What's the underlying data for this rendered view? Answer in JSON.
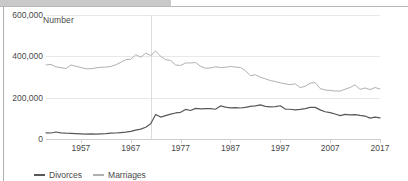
{
  "chart_data": {
    "type": "line",
    "title": "",
    "xlabel": "",
    "ylabel": "Number",
    "xlim": [
      1950,
      2017
    ],
    "ylim": [
      0,
      600000
    ],
    "grid": true,
    "legend_position": "bottom-left",
    "yticks": [
      "0",
      "200,000",
      "400,000",
      "600,000"
    ],
    "ytick_values": [
      0,
      200000,
      400000,
      600000
    ],
    "xticks": [
      "1957",
      "1967",
      "1977",
      "1987",
      "1997",
      "2007",
      "2017"
    ],
    "xtick_values": [
      1957,
      1967,
      1977,
      1987,
      1997,
      2007,
      2017
    ],
    "annotations": [
      {
        "type": "vertical-line",
        "x": 1971,
        "label": ""
      }
    ],
    "x": [
      1950,
      1951,
      1952,
      1953,
      1954,
      1955,
      1956,
      1957,
      1958,
      1959,
      1960,
      1961,
      1962,
      1963,
      1964,
      1965,
      1966,
      1967,
      1968,
      1969,
      1970,
      1971,
      1972,
      1973,
      1974,
      1975,
      1976,
      1977,
      1978,
      1979,
      1980,
      1981,
      1982,
      1983,
      1984,
      1985,
      1986,
      1987,
      1988,
      1989,
      1990,
      1991,
      1992,
      1993,
      1994,
      1995,
      1996,
      1997,
      1998,
      1999,
      2000,
      2001,
      2002,
      2003,
      2004,
      2005,
      2006,
      2007,
      2008,
      2009,
      2010,
      2011,
      2012,
      2013,
      2014,
      2015,
      2016,
      2017
    ],
    "series": [
      {
        "name": "Divorces",
        "color": "#585858",
        "values": [
          30000,
          29000,
          34000,
          30000,
          28000,
          27000,
          26000,
          25000,
          24000,
          25000,
          24000,
          25000,
          26000,
          28000,
          29000,
          31000,
          33000,
          37000,
          43000,
          48000,
          57000,
          74000,
          119000,
          106000,
          113000,
          120000,
          126000,
          129000,
          143000,
          138000,
          148000,
          146000,
          147000,
          147000,
          144000,
          160000,
          154000,
          151000,
          152000,
          150000,
          153000,
          158000,
          160000,
          165000,
          158000,
          155000,
          157000,
          161000,
          145000,
          144000,
          141000,
          143000,
          147000,
          153000,
          153000,
          141000,
          132000,
          128000,
          121000,
          113000,
          119000,
          117000,
          118000,
          114000,
          111000,
          101000,
          106000,
          102000
        ]
      },
      {
        "name": "Marriages",
        "color": "#b0b0b0",
        "values": [
          358000,
          361000,
          349000,
          345000,
          341000,
          358000,
          352000,
          346000,
          340000,
          340000,
          344000,
          347000,
          348000,
          351000,
          359000,
          371000,
          384000,
          386000,
          408000,
          396000,
          415000,
          404000,
          426000,
          400000,
          384000,
          380000,
          358000,
          356000,
          368000,
          368000,
          370000,
          352000,
          342000,
          344000,
          349000,
          346000,
          347000,
          351000,
          348000,
          346000,
          331000,
          306000,
          311000,
          299000,
          291000,
          283000,
          278000,
          272000,
          267000,
          263000,
          267000,
          249000,
          255000,
          270000,
          273000,
          244000,
          237000,
          235000,
          232000,
          232000,
          241000,
          249000,
          262000,
          240000,
          247000,
          239000,
          249000,
          242000
        ]
      }
    ]
  },
  "legend": {
    "items": [
      {
        "label": "Divorces",
        "color": "#585858"
      },
      {
        "label": "Marriages",
        "color": "#b0b0b0"
      }
    ]
  }
}
